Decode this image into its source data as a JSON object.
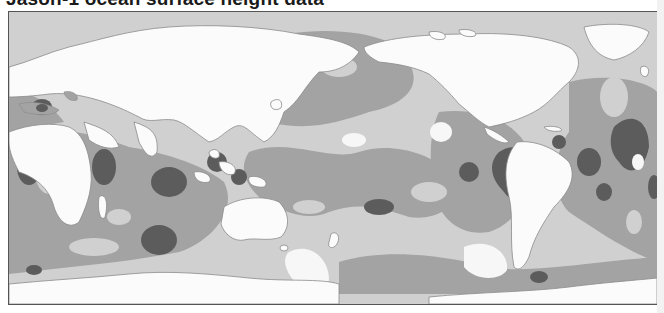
{
  "title": "Jason-1 ocean surface height data",
  "map": {
    "projection": "equirectangular, Pacific-centered",
    "legend_tones": [
      {
        "name": "land-or-highest",
        "color": "#fbfbfb"
      },
      {
        "name": "light",
        "color": "#d0d0d0"
      },
      {
        "name": "medium",
        "color": "#a3a3a3"
      },
      {
        "name": "dark",
        "color": "#5c5c5c"
      }
    ],
    "border_color": "#555555",
    "regions_labeled": []
  }
}
